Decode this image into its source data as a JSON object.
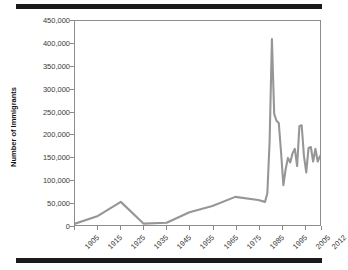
{
  "figure": {
    "top_rule": "decorative-rule",
    "bottom_rule": "decorative-rule",
    "line_color": "#969696",
    "axis_color": "#8d8d8d",
    "text_color": "#3a3a3a"
  },
  "chart_data": {
    "type": "line",
    "title": "",
    "xlabel": "",
    "ylabel": "Number of Immigrants",
    "ylim": [
      0,
      450000
    ],
    "xlim": [
      1905,
      2012
    ],
    "grid": false,
    "legend": null,
    "ytick_labels": [
      "450,000",
      "400,000",
      "350,000",
      "300,000",
      "250,000",
      "200,000",
      "150,000",
      "100,000",
      "50,000",
      "0"
    ],
    "ytick_values": [
      450000,
      400000,
      350000,
      300000,
      250000,
      200000,
      150000,
      100000,
      50000,
      0
    ],
    "xtick_labels": [
      "1905",
      "1915",
      "1925",
      "1935",
      "1945",
      "1955",
      "1965",
      "1975",
      "1985",
      "1995",
      "2005",
      "2012"
    ],
    "xtick_values": [
      1905,
      1915,
      1925,
      1935,
      1945,
      1955,
      1965,
      1975,
      1985,
      1995,
      2005,
      2012
    ],
    "series": [
      {
        "name": "Number of Immigrants",
        "color": "#969696",
        "x": [
          1905,
          1915,
          1925,
          1935,
          1945,
          1955,
          1965,
          1975,
          1985,
          1988,
          1989,
          1990,
          1991,
          1992,
          1993,
          1994,
          1995,
          1996,
          1997,
          1998,
          1999,
          2000,
          2001,
          2002,
          2003,
          2004,
          2005,
          2006,
          2007,
          2008,
          2009,
          2010,
          2011,
          2012
        ],
        "y": [
          3000,
          20000,
          51000,
          3000,
          5000,
          28000,
          42000,
          62000,
          55000,
          51000,
          70000,
          185000,
          410000,
          245000,
          230000,
          225000,
          160000,
          88000,
          123000,
          148000,
          138000,
          158000,
          168000,
          130000,
          218000,
          220000,
          152000,
          116000,
          170000,
          172000,
          140000,
          168000,
          140000,
          152000
        ]
      }
    ]
  }
}
